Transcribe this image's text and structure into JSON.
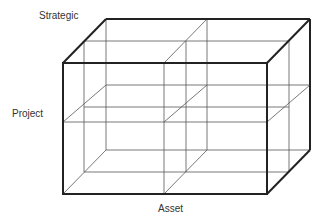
{
  "diagram": {
    "type": "cube-matrix",
    "labels": {
      "top": "Strategic",
      "left": "Project",
      "bottom": "Asset"
    },
    "colors": {
      "outline": "#222222",
      "inner": "#555555",
      "text": "#333333"
    }
  }
}
